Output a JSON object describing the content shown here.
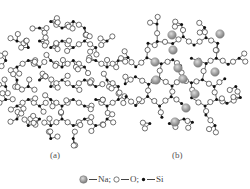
{
  "figure": {
    "panels": [
      {
        "id": "a",
        "label": "(a)",
        "description": "crystalline SiO2 network (regular rings)",
        "label_pos": [
          52,
          152
        ]
      },
      {
        "id": "b",
        "label": "(b)",
        "description": "sodium silicate glass network (disordered, with Na)",
        "label_pos": [
          175,
          152
        ]
      }
    ],
    "legend": {
      "items": [
        {
          "symbol": "gray-sphere",
          "label": "Na",
          "sep": ";"
        },
        {
          "symbol": "open-circle",
          "label": "O",
          "sep": ";"
        },
        {
          "symbol": "filled-dot",
          "label": "Si",
          "sep": ""
        }
      ]
    },
    "colors": {
      "oxygen_fill": "#ffffff",
      "oxygen_stroke": "#333333",
      "silicon": "#111111",
      "sodium": "#9a9a9a",
      "bond": "#222222"
    }
  }
}
